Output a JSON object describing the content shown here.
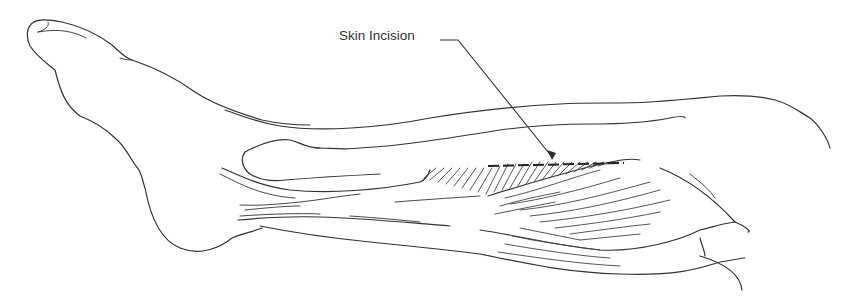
{
  "figure": {
    "labels": [
      {
        "id": "skin-incision",
        "text": "Skin Incision"
      }
    ],
    "colors": {
      "line": "#333333",
      "background": "#ffffff"
    }
  }
}
